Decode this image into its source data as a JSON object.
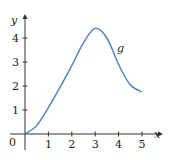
{
  "chart_data": {
    "type": "line",
    "title": "",
    "xlabel": "x",
    "ylabel": "y",
    "xlim": [
      0,
      5.5
    ],
    "ylim": [
      0,
      4.8
    ],
    "grid": false,
    "x_ticks": [
      "1",
      "2",
      "3",
      "4",
      "5"
    ],
    "y_ticks": [
      "1",
      "2",
      "3",
      "4"
    ],
    "origin_label": "0",
    "series": [
      {
        "name": "g",
        "color": "#4a7fc0",
        "x": [
          0,
          0.5,
          1,
          1.5,
          2,
          2.5,
          3,
          3.5,
          4,
          4.5,
          5
        ],
        "y": [
          0,
          0.35,
          1.1,
          1.95,
          2.85,
          3.8,
          4.4,
          4.0,
          2.9,
          2.05,
          1.75
        ]
      }
    ],
    "annotations": [
      {
        "text": "g",
        "x": 3.9,
        "y": 3.6
      }
    ]
  }
}
